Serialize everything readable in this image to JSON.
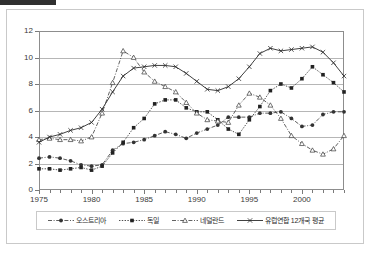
{
  "chart_data": {
    "type": "line",
    "title": "",
    "xlabel": "",
    "ylabel": "",
    "xlim": [
      1975,
      2004
    ],
    "ylim": [
      0,
      12
    ],
    "grid": true,
    "legend_position": "bottom",
    "y_ticks": [
      "0",
      "2",
      "4",
      "6",
      "8",
      "10",
      "12"
    ],
    "x_ticks": [
      "1975",
      "1980",
      "1985",
      "1990",
      "1995",
      "2000"
    ],
    "x": [
      1975,
      1976,
      1977,
      1978,
      1979,
      1980,
      1981,
      1982,
      1983,
      1984,
      1985,
      1986,
      1987,
      1988,
      1989,
      1990,
      1991,
      1992,
      1993,
      1994,
      1995,
      1996,
      1997,
      1998,
      1999,
      2000,
      2001,
      2002,
      2003,
      2004
    ],
    "series": [
      {
        "name": "오스트리아",
        "marker": "filled-circle",
        "line_style": "dash-dot",
        "color": "#333333",
        "values": [
          2.4,
          2.5,
          2.4,
          2.2,
          1.9,
          1.8,
          1.9,
          3.0,
          3.5,
          3.6,
          3.8,
          4.1,
          4.4,
          4.2,
          3.9,
          4.3,
          4.6,
          4.9,
          5.5,
          5.5,
          5.5,
          5.8,
          5.8,
          5.9,
          5.4,
          4.8,
          4.9,
          5.7,
          5.9,
          5.9
        ]
      },
      {
        "name": "독일",
        "marker": "filled-square",
        "line_style": "dotted",
        "color": "#222222",
        "values": [
          1.6,
          1.6,
          1.5,
          1.6,
          1.7,
          1.5,
          1.8,
          2.8,
          3.6,
          4.7,
          5.4,
          6.5,
          6.8,
          6.8,
          6.2,
          5.9,
          5.9,
          5.3,
          4.6,
          4.2,
          5.3,
          6.3,
          7.5,
          8.0,
          7.7,
          8.4,
          9.3,
          8.7,
          8.1,
          7.4
        ]
      },
      {
        "name": "네덜란드",
        "marker": "open-triangle",
        "line_style": "dash-dot",
        "color": "#3a3a3a",
        "values": [
          3.8,
          3.9,
          3.8,
          3.8,
          3.7,
          4.0,
          5.8,
          8.1,
          10.5,
          10.0,
          8.9,
          8.2,
          7.8,
          7.4,
          6.6,
          5.8,
          5.3,
          5.2,
          5.1,
          6.4,
          7.3,
          7.0,
          6.4,
          5.4,
          4.1,
          3.5,
          3.0,
          2.7,
          3.1,
          4.1
        ]
      },
      {
        "name": "유럽연합 12개국 평균",
        "marker": "cross",
        "line_style": "solid",
        "color": "#2b2b2b",
        "values": [
          3.6,
          4.0,
          4.2,
          4.5,
          4.7,
          5.1,
          6.1,
          7.4,
          8.6,
          9.2,
          9.3,
          9.4,
          9.4,
          9.3,
          8.8,
          8.2,
          7.6,
          7.5,
          7.8,
          8.4,
          9.3,
          10.3,
          10.7,
          10.5,
          10.6,
          10.7,
          10.8,
          10.4,
          9.6,
          8.6
        ]
      }
    ],
    "series_tail": {
      "note": "final observed endpoints",
      "eu_end": 8.9,
      "germany_end": 9.3,
      "austria_end": 5.9,
      "netherlands_end": 5.0
    }
  },
  "legend": {
    "entries": [
      {
        "label": "오스트리아"
      },
      {
        "label": "독일"
      },
      {
        "label": "네덜란드"
      },
      {
        "label": "유럽연합 12개국 평균"
      }
    ]
  }
}
